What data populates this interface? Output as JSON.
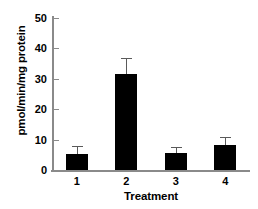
{
  "chart_data": {
    "type": "bar",
    "title": "",
    "xlabel": "Treatment",
    "ylabel": "pmol/min/mg protein",
    "categories": [
      "1",
      "2",
      "3",
      "4"
    ],
    "values": [
      5.3,
      31.5,
      5.5,
      8.2
    ],
    "errors": [
      2.6,
      5.5,
      2.2,
      2.6
    ],
    "ylim": [
      0,
      50
    ],
    "yticks": [
      0,
      10,
      20,
      30,
      40,
      50
    ],
    "ytick_labels": [
      "0",
      "10",
      "20",
      "30",
      "40",
      "50"
    ],
    "grid": false,
    "legend": null,
    "series": [
      {
        "name": "pmol/min/mg protein",
        "values": [
          5.3,
          31.5,
          5.5,
          8.2
        ],
        "errors": [
          2.6,
          5.5,
          2.2,
          2.6
        ],
        "color": "#000000"
      }
    ],
    "colors": {
      "bar": "#000000",
      "axis": "#8a8a8a",
      "error_bar": "#5a5a5a",
      "background": "#ffffff",
      "text": "#000000"
    }
  }
}
